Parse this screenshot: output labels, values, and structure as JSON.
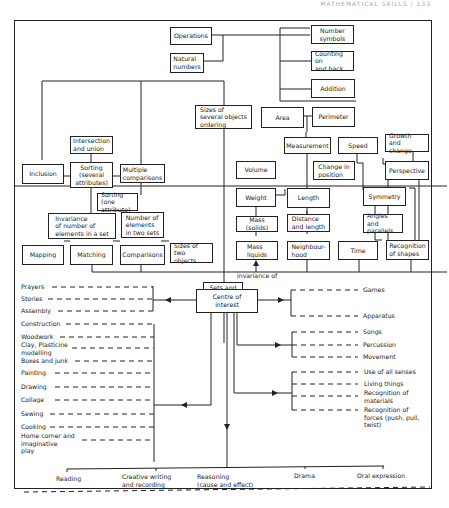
{
  "header": {
    "text": "MATHEMATICAL SKILLS / 133"
  },
  "boxes": {
    "operations": "Operations",
    "natural_numbers": "Natural\nnumbers",
    "number_symbols": "Number\nsymbols",
    "counting_on_back": "Counting on\nand back",
    "addition": "Addition",
    "sizes_several": "Sizes of\nseveral objects\nordering",
    "area": "Area",
    "perimeter": "Perimeter",
    "intersection_union": "Intersection\nand union",
    "inclusion": "Inclusion",
    "sorting_several": "Sorting\n(several\nattributes)",
    "multiple_comparisons": "Multiple\ncomparisons",
    "measurement": "Measurement",
    "speed": "Speed",
    "growth_change": "Growth\nand change",
    "volume": "Volume",
    "change_position": "Change in\nposition",
    "perspective": "Perspective",
    "weight": "Weight",
    "length": "Length",
    "symmetry": "Symmetry",
    "sorting_one": "Sorting (one\nattribute)",
    "mass_solids": "Mass (solids)",
    "distance_length": "Distance\nand length",
    "angles_parallels": "Angles and\nparallels",
    "invariance_set": "Invariance\nof number of\nelements in a set",
    "number_two_sets": "Number of\nelements\nin two sets",
    "mapping": "Mapping",
    "matching": "Matching",
    "comparisons": "Comparisons",
    "sizes_two": "Sizes of\ntwo objects",
    "mass_liquids": "Mass\nliquids",
    "neighbourhood": "Neighbour-\nhood",
    "time": "Time",
    "recognition_shapes": "Recognition\nof shapes",
    "sets_relations": "Sets and\nrelations",
    "centre_interest": "Centre of interest"
  },
  "labels": {
    "invariance_of": "invariance of"
  },
  "left_activities": {
    "group1": [
      "Prayers",
      "Stories",
      "Assembly"
    ],
    "group2": [
      "Construction",
      "Woodwork",
      "Clay, Plasticine\nmodelling",
      "Boxes and junk",
      "Painting",
      "Drawing",
      "Collage",
      "Sewing",
      "Cooking",
      "Home corner and\nimaginative\nplay"
    ]
  },
  "right_activities": {
    "group1": [
      "Games",
      "Apparatus"
    ],
    "group2": [
      "Songs",
      "Percussion",
      "Movement"
    ],
    "group3": [
      "Use of all senses",
      "Living things",
      "Recognition of\nmaterials",
      "Recognition of\nforces (push, pull,\ntwist)"
    ]
  },
  "bottom_activities": [
    "Reading",
    "Creative writing\nand recording",
    "Reasoning\n(cause and effect)",
    "Drama",
    "Oral expression"
  ]
}
